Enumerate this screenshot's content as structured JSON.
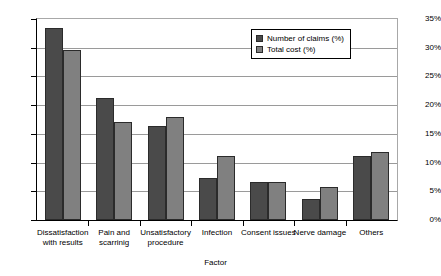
{
  "chart_data": {
    "type": "bar",
    "title": "",
    "xlabel": "Factor",
    "ylabel": "",
    "ylim": [
      0,
      35
    ],
    "ytick_labels": [
      "0%",
      "5%",
      "10%",
      "15%",
      "20%",
      "25%",
      "30%",
      "35%"
    ],
    "ytick_values": [
      0,
      5,
      10,
      15,
      20,
      25,
      30,
      35
    ],
    "grid": true,
    "legend_position": "top-right",
    "categories": [
      "Dissatisfaction with results",
      "Pain and scarrinig",
      "Unsatisfactory procedure",
      "Infection",
      "Consent issues",
      "Nerve damage",
      "Others"
    ],
    "category_lines": [
      [
        "Dissatisfaction",
        "with results"
      ],
      [
        "Pain and",
        "scarrinig"
      ],
      [
        "Unsatisfactory",
        "procedure"
      ],
      [
        "Infection"
      ],
      [
        "Consent issues"
      ],
      [
        "Nerve damage"
      ],
      [
        "Others"
      ]
    ],
    "series": [
      {
        "name": "Number of claims (%)",
        "color": "#4a4a4a",
        "values": [
          33.5,
          21.3,
          16.3,
          7.4,
          6.7,
          3.7,
          11.1
        ]
      },
      {
        "name": "Total cost (%)",
        "color": "#808080",
        "values": [
          29.6,
          17.0,
          17.9,
          11.2,
          6.7,
          5.8,
          11.8
        ]
      }
    ]
  },
  "legend": {
    "items": [
      {
        "label": "Number of claims (%)"
      },
      {
        "label": "Total cost (%)"
      }
    ]
  }
}
